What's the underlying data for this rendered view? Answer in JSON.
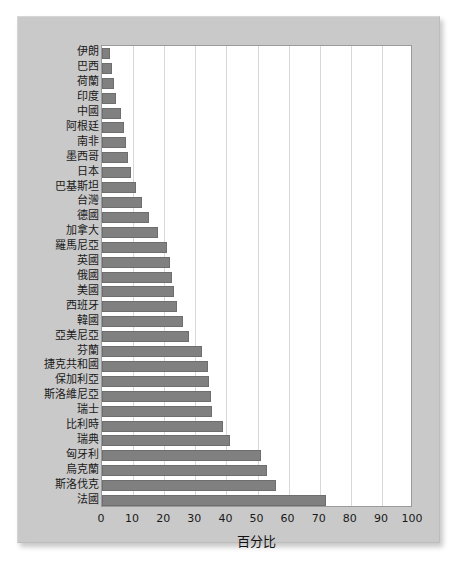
{
  "chart_data": {
    "type": "bar",
    "orientation": "horizontal",
    "title": "",
    "xlabel": "百分比",
    "ylabel": "",
    "xlim": [
      0,
      100
    ],
    "xticks": [
      0,
      10,
      20,
      30,
      40,
      50,
      60,
      70,
      80,
      90,
      100
    ],
    "grid": "vertical",
    "legend": "none",
    "bar_color": "#808080",
    "bar_edge_color": "#6e6e6e",
    "plot_background": "#ffffff",
    "figure_background": "#c9c9c9",
    "categories": [
      "伊朗",
      "巴西",
      "荷蘭",
      "印度",
      "中國",
      "阿根廷",
      "南非",
      "墨西哥",
      "日本",
      "巴基斯坦",
      "台灣",
      "德國",
      "加拿大",
      "羅馬尼亞",
      "英國",
      "俄國",
      "美國",
      "西班牙",
      "韓國",
      "亞美尼亞",
      "芬蘭",
      "捷克共和國",
      "保加利亞",
      "斯洛維尼亞",
      "瑞士",
      "比利時",
      "瑞典",
      "匈牙利",
      "烏克蘭",
      "斯洛伐克",
      "法國"
    ],
    "values": [
      2.5,
      3.2,
      4.0,
      4.6,
      6.0,
      7.0,
      7.6,
      8.5,
      9.2,
      11.0,
      13.0,
      15.0,
      18.0,
      21.0,
      22.0,
      22.5,
      23.0,
      24.0,
      26.0,
      28.0,
      32.0,
      34.0,
      34.5,
      35.0,
      35.5,
      39.0,
      41.0,
      51.0,
      53.0,
      56.0,
      72.0
    ]
  }
}
